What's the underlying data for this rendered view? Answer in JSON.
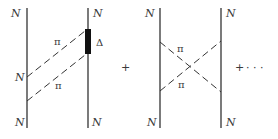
{
  "diagrams": [
    {
      "id": "delta-box",
      "labels": {
        "top_left": "N",
        "top_right": "N",
        "mid_left": "N",
        "bottom_left": "N",
        "bottom_right": "N",
        "pion_upper": "π",
        "pion_lower": "π",
        "delta": "Δ"
      }
    },
    {
      "id": "crossed-box",
      "labels": {
        "top_left": "N",
        "top_right": "N",
        "bottom_left": "N",
        "bottom_right": "N",
        "pion_upper": "π",
        "pion_lower": "π"
      }
    }
  ],
  "operators": {
    "plus_1": "+",
    "plus_2": "+",
    "ellipsis": "· · ·"
  },
  "colors": {
    "line": "#333333",
    "text": "#3a3a3a",
    "delta_fill": "#111111",
    "background": "#ffffff"
  }
}
